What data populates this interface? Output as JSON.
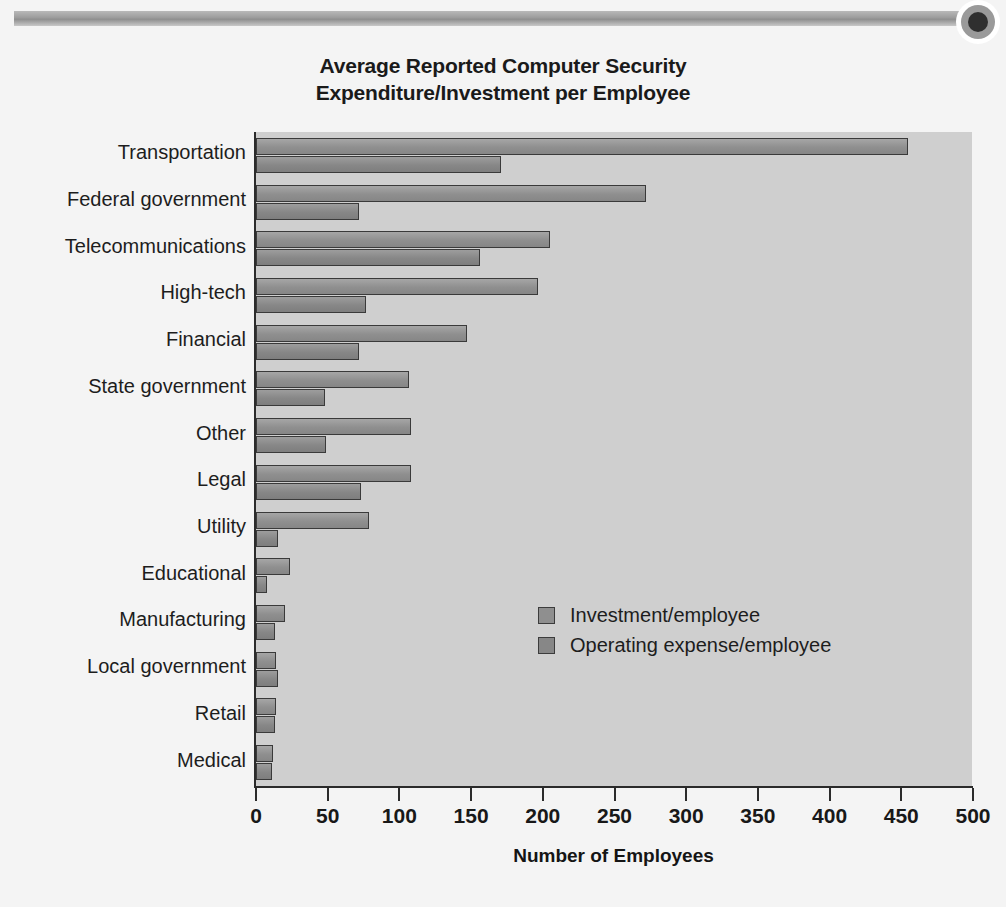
{
  "decor": {
    "band_name": "header-rule",
    "eye_name": "eye-emblem"
  },
  "chart_data": {
    "type": "bar",
    "orientation": "horizontal",
    "title": "Average Reported Computer Security Expenditure/Investment per Employee",
    "title_line1": "Average Reported Computer Security",
    "title_line2": "Expenditure/Investment per Employee",
    "xlabel": "Number of Employees",
    "ylabel": "",
    "xlim": [
      0,
      500
    ],
    "xticks": [
      0,
      50,
      100,
      150,
      200,
      250,
      300,
      350,
      400,
      450,
      500
    ],
    "xtick_labels": [
      "0",
      "50",
      "100",
      "150",
      "200",
      "250",
      "300",
      "350",
      "400",
      "450",
      "500"
    ],
    "grid": false,
    "legend_position": "center-right-inside",
    "categories": [
      "Transportation",
      "Federal government",
      "Telecommunications",
      "High-tech",
      "Financial",
      "State government",
      "Other",
      "Legal",
      "Utility",
      "Educational",
      "Manufacturing",
      "Local government",
      "Retail",
      "Medical"
    ],
    "series": [
      {
        "name": "Investment/employee",
        "color": "#8f8f8f",
        "values": [
          455,
          272,
          205,
          197,
          147,
          107,
          108,
          108,
          79,
          24,
          20,
          14,
          14,
          12
        ]
      },
      {
        "name": "Operating expense/employee",
        "color": "#878787",
        "values": [
          171,
          72,
          156,
          77,
          72,
          48,
          49,
          73,
          15,
          8,
          13,
          15,
          13,
          11
        ]
      }
    ]
  },
  "colors": {
    "page_background": "#f4f4f4",
    "plot_background": "#cfcfcf",
    "axis": "#2b2b2b",
    "bar_border": "#3a3a3a",
    "text": "#1a1a1a"
  }
}
